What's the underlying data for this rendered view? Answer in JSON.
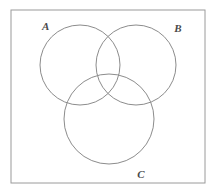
{
  "figure": {
    "name": "three-set-venn-diagram",
    "width": 216,
    "height": 195,
    "background_color": "#ffffff"
  },
  "universe_frame": {
    "name": "universal-set-rectangle",
    "x": 11,
    "y": 10,
    "width": 194,
    "height": 173,
    "stroke_color": "#9a9a9a",
    "stroke_width": 1,
    "fill": "none"
  },
  "circles": [
    {
      "id": "A",
      "label": "A",
      "cx": 80,
      "cy": 65,
      "r": 40,
      "stroke_color": "#8c8c8c",
      "stroke_width": 1,
      "fill": "none"
    },
    {
      "id": "B",
      "label": "B",
      "cx": 136,
      "cy": 65,
      "r": 40,
      "stroke_color": "#8c8c8c",
      "stroke_width": 1,
      "fill": "none"
    },
    {
      "id": "C",
      "label": "C",
      "cx": 109,
      "cy": 119,
      "r": 45,
      "stroke_color": "#8c8c8c",
      "stroke_width": 1,
      "fill": "none"
    }
  ],
  "labels": [
    {
      "id": "A",
      "text": "A",
      "x": 42,
      "y": 30,
      "anchor": "start"
    },
    {
      "id": "B",
      "text": "B",
      "x": 178,
      "y": 32,
      "anchor": "middle"
    },
    {
      "id": "C",
      "text": "C",
      "x": 141,
      "y": 178,
      "anchor": "middle"
    }
  ],
  "style": {
    "label_color": "#4a4a4a",
    "line_color": "#8c8c8c",
    "frame_color": "#9a9a9a"
  }
}
